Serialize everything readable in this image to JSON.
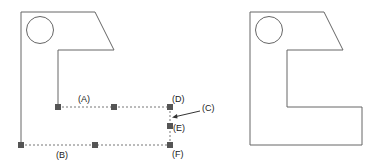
{
  "diagram": {
    "left_figure": {
      "labels": {
        "A": "(A)",
        "B": "(B)",
        "C": "(C)",
        "D": "(D)",
        "E": "(E)",
        "F": "(F)"
      }
    },
    "right_figure": {}
  },
  "colors": {
    "stroke": "#555555",
    "marker": "#555555",
    "text": "#222222"
  }
}
